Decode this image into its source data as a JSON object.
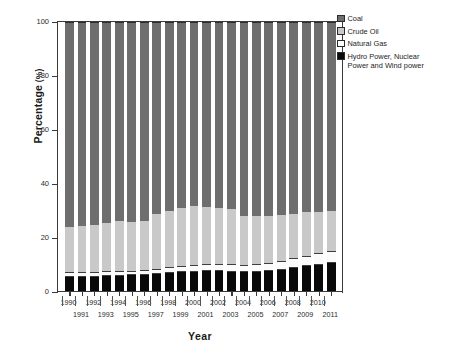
{
  "chart_data": {
    "type": "bar",
    "subtype": "stacked-bar-100-percent",
    "title": "",
    "xlabel": "Year",
    "ylabel": "Percentage (%)",
    "ylim": [
      0,
      100
    ],
    "yticks": [
      0,
      20,
      40,
      60,
      80,
      100
    ],
    "grid": false,
    "legend_position": "top-right",
    "categories": [
      "1990",
      "1991",
      "1992",
      "1993",
      "1994",
      "1995",
      "1996",
      "1997",
      "1998",
      "1999",
      "2000",
      "2001",
      "2002",
      "2003",
      "2004",
      "2005",
      "2006",
      "2007",
      "2008",
      "2009",
      "2010",
      "2011"
    ],
    "series": [
      {
        "name": "Hydro Power, Nuclear Power and Wind power",
        "color": "#0a0a0a",
        "values": [
          5.1,
          5.1,
          5.2,
          5.4,
          5.6,
          5.8,
          5.9,
          6.3,
          6.8,
          7.0,
          7.2,
          7.4,
          7.3,
          7.1,
          6.9,
          7.1,
          7.4,
          7.8,
          8.6,
          9.2,
          9.8,
          10.4
        ]
      },
      {
        "name": "Natural Gas",
        "color": "#ffffff",
        "values": [
          2.1,
          2.0,
          1.9,
          1.9,
          1.9,
          1.8,
          1.8,
          1.8,
          2.0,
          2.2,
          2.4,
          2.5,
          2.6,
          2.8,
          2.6,
          2.8,
          3.0,
          3.3,
          3.8,
          4.0,
          4.4,
          4.6
        ]
      },
      {
        "name": "Crude Oil",
        "color": "#c9c9c9",
        "values": [
          16.6,
          17.0,
          17.4,
          18.0,
          18.4,
          17.9,
          18.2,
          20.4,
          20.8,
          21.6,
          22.0,
          21.2,
          21.1,
          20.5,
          18.3,
          18.1,
          17.6,
          17.2,
          16.2,
          16.0,
          15.2,
          14.8
        ]
      },
      {
        "name": "Coal",
        "color": "#6e6e6e",
        "values": [
          76.2,
          75.9,
          75.5,
          74.7,
          74.1,
          74.5,
          74.1,
          71.5,
          70.4,
          69.2,
          68.4,
          68.9,
          69.0,
          69.6,
          72.2,
          72.0,
          72.0,
          71.7,
          71.4,
          70.8,
          70.6,
          70.2
        ]
      }
    ]
  },
  "legend": {
    "items": [
      {
        "label": "Coal",
        "swatch": "sw-coal"
      },
      {
        "label": "Crude Oil",
        "swatch": "sw-oil"
      },
      {
        "label": "Natural Gas",
        "swatch": "sw-gas"
      },
      {
        "label": "Hydro Power, Nuclear\nPower and Wind power",
        "swatch": "sw-hydro"
      }
    ]
  },
  "axis": {
    "y_title_main": "Percentage",
    "y_title_unit": " (%)",
    "x_title": "Year"
  }
}
